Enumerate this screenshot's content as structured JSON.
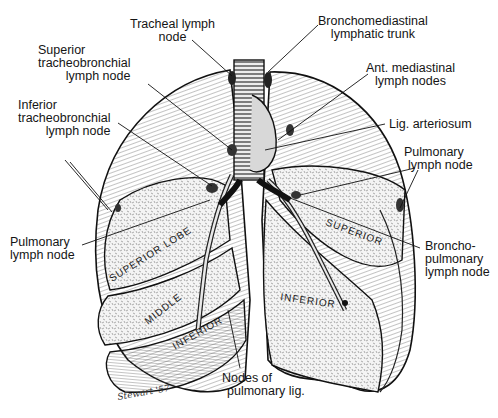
{
  "figure": {
    "colors": {
      "ink": "#151515",
      "paper": "#ffffff",
      "hatch": "#5a5a5a"
    }
  },
  "labels": {
    "tracheal": [
      "Tracheal lymph",
      "node"
    ],
    "bronchomediastinal": [
      "Bronchomediastinal",
      "lymphatic trunk"
    ],
    "superior_tracheobronchial": [
      "Superior",
      "tracheobronchial",
      "lymph node"
    ],
    "ant_mediastinal": [
      "Ant. mediastinal",
      "lymph nodes"
    ],
    "inferior_tracheobronchial": [
      "Inferior",
      "tracheobronchial",
      "lymph node"
    ],
    "lig_arteriosum": [
      "Lig. arteriosum"
    ],
    "pulmonary_right": [
      "Pulmonary",
      "lymph node"
    ],
    "pulmonary_left": [
      "Pulmonary",
      "lymph node"
    ],
    "bronchopulmonary": [
      "Broncho-",
      "pulmonary",
      "lymph node"
    ],
    "pulmonary_lig": [
      "Nodes of",
      "pulmonary lig."
    ]
  },
  "lobes": {
    "right_superior": "SUPERIOR LOBE",
    "right_middle": "MIDDLE",
    "right_inferior": "INFERIOR",
    "left_superior": "SUPERIOR",
    "left_inferior": "INFERIOR"
  },
  "signature": "Stewart '57"
}
